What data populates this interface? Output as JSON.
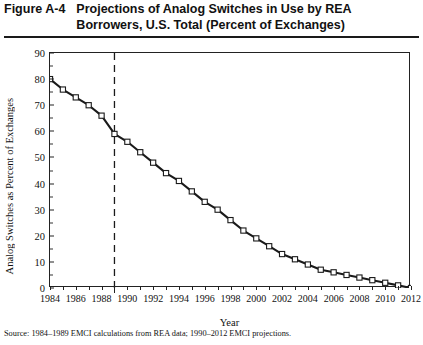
{
  "figure": {
    "number": "Figure A-4",
    "title_line1": "Projections of Analog Switches in Use by REA",
    "title_line2": "Borrowers, U.S. Total (Percent of Exchanges)"
  },
  "source_note": "Source: 1984–1989 EMCI calculations from REA data; 1990–2012 EMCI projections.",
  "chart_data": {
    "type": "line",
    "title": "Projections of Analog Switches in Use by REA Borrowers, U.S. Total (Percent of Exchanges)",
    "xlabel": "Year",
    "ylabel": "Analog Switches as Percent of Exchanges",
    "xlim": [
      1984,
      2012
    ],
    "ylim": [
      0,
      90
    ],
    "ytick_step": 10,
    "yticks": [
      0,
      10,
      20,
      30,
      40,
      50,
      60,
      70,
      80,
      90
    ],
    "xticks_labeled": [
      1984,
      1986,
      1988,
      1990,
      1992,
      1994,
      1996,
      1998,
      2000,
      2002,
      2004,
      2006,
      2008,
      2010,
      2012
    ],
    "xtick_step_minor": 1,
    "grid": false,
    "legend": null,
    "marker": "open-square",
    "line_color": "#1a1a1a",
    "annotations": [
      {
        "type": "vertical-dashed-line",
        "x": 1989,
        "label": "",
        "meaning": "boundary between historical calculations and projections"
      }
    ],
    "x": [
      1984,
      1985,
      1986,
      1987,
      1988,
      1989,
      1990,
      1991,
      1992,
      1993,
      1994,
      1995,
      1996,
      1997,
      1998,
      1999,
      2000,
      2001,
      2002,
      2003,
      2004,
      2005,
      2006,
      2007,
      2008,
      2009,
      2010,
      2011,
      2012
    ],
    "values": [
      80,
      76,
      73,
      70,
      66,
      59,
      56,
      52,
      48,
      44,
      41,
      37,
      33,
      30,
      26,
      22,
      19,
      16,
      13,
      11,
      9,
      7,
      6,
      5,
      4,
      3,
      2,
      1,
      0
    ],
    "series": [
      {
        "name": "Analog switches as percent of exchanges",
        "values": [
          80,
          76,
          73,
          70,
          66,
          59,
          56,
          52,
          48,
          44,
          41,
          37,
          33,
          30,
          26,
          22,
          19,
          16,
          13,
          11,
          9,
          7,
          6,
          5,
          4,
          3,
          2,
          1,
          0
        ]
      }
    ]
  }
}
